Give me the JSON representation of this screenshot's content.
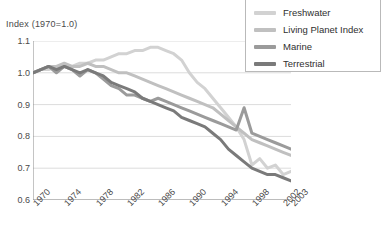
{
  "chart_data": {
    "type": "line",
    "title": "Index (1970=1.0)",
    "xlabel": "",
    "ylabel": "Index (1970=1.0)",
    "ylim": [
      0.6,
      1.1
    ],
    "xlim": [
      1970,
      2003
    ],
    "grid": true,
    "legend_position": "top-right",
    "y_ticks": [
      "1.1",
      "1.0",
      "0.9",
      "0.8",
      "0.7",
      "0.6"
    ],
    "y_tick_values": [
      1.1,
      1.0,
      0.9,
      0.8,
      0.7,
      0.6
    ],
    "x_ticks": [
      "1970",
      "1974",
      "1978",
      "1982",
      "1986",
      "1990",
      "1994",
      "1998",
      "2002",
      "2003"
    ],
    "x_tick_values": [
      1970,
      1974,
      1978,
      1982,
      1986,
      1990,
      1994,
      1998,
      2002,
      2003
    ],
    "x": [
      1970,
      1971,
      1972,
      1973,
      1974,
      1975,
      1976,
      1977,
      1978,
      1979,
      1980,
      1981,
      1982,
      1983,
      1984,
      1985,
      1986,
      1987,
      1988,
      1989,
      1990,
      1991,
      1992,
      1993,
      1994,
      1995,
      1996,
      1997,
      1998,
      1999,
      2000,
      2001,
      2002,
      2003
    ],
    "series": [
      {
        "name": "Freshwater",
        "color": "#d2d2d2",
        "values": [
          1.0,
          1.01,
          1.01,
          1.02,
          1.02,
          1.02,
          1.03,
          1.03,
          1.04,
          1.04,
          1.05,
          1.06,
          1.06,
          1.07,
          1.07,
          1.08,
          1.08,
          1.07,
          1.06,
          1.04,
          1.0,
          0.97,
          0.95,
          0.92,
          0.89,
          0.86,
          0.83,
          0.79,
          0.71,
          0.73,
          0.7,
          0.71,
          0.68,
          0.69
        ]
      },
      {
        "name": "Living Planet Index",
        "color": "#c0c0c0",
        "values": [
          1.0,
          1.01,
          1.02,
          1.02,
          1.03,
          1.02,
          1.02,
          1.03,
          1.02,
          1.02,
          1.01,
          1.0,
          1.0,
          0.99,
          0.98,
          0.97,
          0.96,
          0.95,
          0.94,
          0.93,
          0.92,
          0.91,
          0.9,
          0.89,
          0.87,
          0.85,
          0.83,
          0.81,
          0.79,
          0.78,
          0.77,
          0.76,
          0.75,
          0.74
        ]
      },
      {
        "name": "Marine",
        "color": "#9b9b9b",
        "values": [
          1.0,
          1.01,
          1.02,
          1.0,
          1.02,
          1.01,
          0.99,
          1.01,
          1.0,
          0.98,
          0.96,
          0.95,
          0.93,
          0.93,
          0.92,
          0.91,
          0.92,
          0.91,
          0.9,
          0.89,
          0.88,
          0.87,
          0.86,
          0.85,
          0.84,
          0.83,
          0.82,
          0.89,
          0.81,
          0.8,
          0.79,
          0.78,
          0.77,
          0.76
        ]
      },
      {
        "name": "Terrestrial",
        "color": "#7a7a7a",
        "values": [
          1.0,
          1.01,
          1.02,
          1.01,
          1.02,
          1.01,
          1.0,
          1.01,
          1.0,
          0.99,
          0.97,
          0.96,
          0.95,
          0.94,
          0.92,
          0.91,
          0.9,
          0.89,
          0.88,
          0.86,
          0.85,
          0.84,
          0.83,
          0.81,
          0.79,
          0.76,
          0.74,
          0.72,
          0.7,
          0.69,
          0.68,
          0.68,
          0.67,
          0.66
        ]
      }
    ]
  },
  "legend": {
    "items": [
      {
        "label": "Freshwater"
      },
      {
        "label": "Living Planet Index"
      },
      {
        "label": "Marine"
      },
      {
        "label": "Terrestrial"
      }
    ]
  },
  "colors": {
    "grid": "#dcdcdc",
    "axis": "#8a8a8a",
    "text": "#4a4a4a",
    "legend_border": "#b9b9b9",
    "background": "#ffffff"
  }
}
